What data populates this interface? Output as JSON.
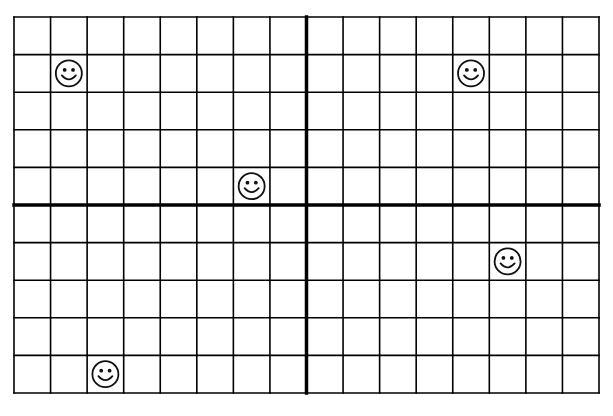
{
  "grid": {
    "columns": 16,
    "rows": 10,
    "y_axis_after_column": 8,
    "x_axis_after_row": 5,
    "line_color": "#000000",
    "background": "#ffffff"
  },
  "markers": [
    {
      "name": "smiley-face",
      "glyph": "☺",
      "col": 1,
      "row": 1
    },
    {
      "name": "smiley-face",
      "glyph": "☺",
      "col": 12,
      "row": 1
    },
    {
      "name": "smiley-face",
      "glyph": "☺",
      "col": 6,
      "row": 4
    },
    {
      "name": "smiley-face",
      "glyph": "☺",
      "col": 13,
      "row": 6
    },
    {
      "name": "smiley-face",
      "glyph": "☺",
      "col": 2,
      "row": 9
    }
  ]
}
